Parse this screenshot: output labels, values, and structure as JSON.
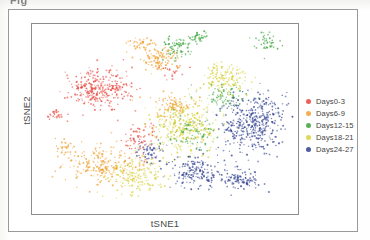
{
  "figure": {
    "top_cropped_text": "Fig",
    "background_color": "#fdfdfc",
    "frame_color": "#9a9a9a",
    "panel_color": "#8d8d8d"
  },
  "axes": {
    "xlabel": "tSNE1",
    "ylabel": "tSNE2"
  },
  "legend": {
    "entries": [
      {
        "label": "Days0-3",
        "color": "#e8453c"
      },
      {
        "label": "Days6-9",
        "color": "#f0a030"
      },
      {
        "label": "Days12-15",
        "color": "#3aa33a"
      },
      {
        "label": "Days18-21",
        "color": "#d8d23a"
      },
      {
        "label": "Days24-27",
        "color": "#2f3f8f"
      }
    ]
  },
  "chart_data": {
    "type": "scatter",
    "title": "",
    "xlabel": "tSNE1",
    "ylabel": "tSNE2",
    "xlim": [
      0,
      100
    ],
    "ylim": [
      0,
      100
    ],
    "grid": false,
    "legend_position": "right",
    "axis_ticks": [],
    "marker_size_px": 1.6,
    "marker_opacity": 0.8,
    "series": [
      {
        "name": "Days0-3",
        "color": "#e8453c",
        "approx_count": 420,
        "clusters": [
          {
            "cx": 25,
            "cy": 66,
            "rx": 13,
            "ry": 11,
            "n": 300
          },
          {
            "cx": 9,
            "cy": 52,
            "rx": 3,
            "ry": 3,
            "n": 28
          },
          {
            "cx": 40,
            "cy": 40,
            "rx": 7,
            "ry": 10,
            "n": 70
          },
          {
            "cx": 53,
            "cy": 76,
            "rx": 5,
            "ry": 5,
            "n": 22
          }
        ]
      },
      {
        "name": "Days6-9",
        "color": "#f0a030",
        "approx_count": 520,
        "clusters": [
          {
            "cx": 27,
            "cy": 26,
            "rx": 15,
            "ry": 11,
            "n": 230
          },
          {
            "cx": 48,
            "cy": 82,
            "rx": 8,
            "ry": 7,
            "n": 120
          },
          {
            "cx": 53,
            "cy": 57,
            "rx": 9,
            "ry": 7,
            "n": 95
          },
          {
            "cx": 41,
            "cy": 89,
            "rx": 6,
            "ry": 5,
            "n": 45
          },
          {
            "cx": 12,
            "cy": 35,
            "rx": 4,
            "ry": 5,
            "n": 30
          }
        ]
      },
      {
        "name": "Days12-15",
        "color": "#3aa33a",
        "approx_count": 330,
        "clusters": [
          {
            "cx": 55,
            "cy": 88,
            "rx": 6,
            "ry": 6,
            "n": 70
          },
          {
            "cx": 63,
            "cy": 93,
            "rx": 4,
            "ry": 4,
            "n": 40
          },
          {
            "cx": 88,
            "cy": 90,
            "rx": 5,
            "ry": 5,
            "n": 45
          },
          {
            "cx": 60,
            "cy": 43,
            "rx": 10,
            "ry": 10,
            "n": 95
          },
          {
            "cx": 72,
            "cy": 62,
            "rx": 9,
            "ry": 9,
            "n": 80
          }
        ]
      },
      {
        "name": "Days18-21",
        "color": "#d8d23a",
        "approx_count": 640,
        "clusters": [
          {
            "cx": 56,
            "cy": 46,
            "rx": 15,
            "ry": 15,
            "n": 330
          },
          {
            "cx": 40,
            "cy": 20,
            "rx": 12,
            "ry": 10,
            "n": 170
          },
          {
            "cx": 72,
            "cy": 72,
            "rx": 10,
            "ry": 9,
            "n": 140
          }
        ]
      },
      {
        "name": "Days24-27",
        "color": "#2f3f8f",
        "approx_count": 760,
        "clusters": [
          {
            "cx": 83,
            "cy": 48,
            "rx": 13,
            "ry": 17,
            "n": 420
          },
          {
            "cx": 62,
            "cy": 22,
            "rx": 11,
            "ry": 9,
            "n": 180
          },
          {
            "cx": 78,
            "cy": 18,
            "rx": 8,
            "ry": 6,
            "n": 100
          },
          {
            "cx": 45,
            "cy": 32,
            "rx": 6,
            "ry": 6,
            "n": 60
          }
        ]
      }
    ]
  }
}
